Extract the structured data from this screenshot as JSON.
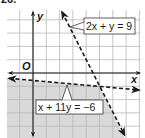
{
  "problem_number": "26.",
  "axes": {
    "x_label": "x",
    "y_label": "y",
    "origin_label": "O"
  },
  "grid": {
    "x_range": [
      -2,
      8
    ],
    "y_range": [
      -5,
      5
    ],
    "unit_px": 13.3,
    "origin_px": [
      33,
      73
    ]
  },
  "lines": [
    {
      "equation": "2x + y = 9",
      "style": "dashed",
      "label_box": {
        "x": 84,
        "y": 18,
        "w": 51,
        "h": 16
      }
    },
    {
      "equation": "x + 11y = −6",
      "style": "dashed",
      "label_box": {
        "x": 36,
        "y": 100,
        "w": 67,
        "h": 14
      }
    }
  ],
  "shaded_region": {
    "description": "Region below x + 11y = −6 and left of 2x + y = 9",
    "color": "#d9d9d9"
  },
  "intersection": {
    "x": 5,
    "y": -1
  },
  "colors": {
    "grid": "#b8b8b8",
    "axis": "#1a1a1a",
    "line": "#1a1a1a",
    "shade": "#d9d9d9"
  }
}
